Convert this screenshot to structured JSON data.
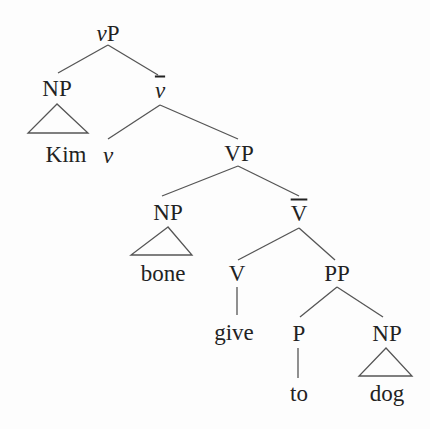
{
  "tree": {
    "root": "vP",
    "nodes": {
      "vP": {
        "prefix": "v",
        "label": "P"
      },
      "NP_subj": "NP",
      "vbar": "v",
      "Kim": "Kim",
      "v": "v",
      "VP": "VP",
      "NP_obj": "NP",
      "Vbar": "V",
      "bone": "bone",
      "V": "V",
      "PP": "PP",
      "give": "give",
      "P": "P",
      "NP_pobj": "NP",
      "to": "to",
      "dog": "dog"
    }
  }
}
